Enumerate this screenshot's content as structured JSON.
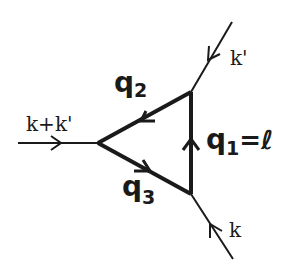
{
  "diagram": {
    "type": "feynman-triangle-diagram",
    "colors": {
      "line": "#1a1a1a",
      "background": "#ffffff"
    },
    "vertices": [
      {
        "id": "left",
        "x": 98,
        "y": 143
      },
      {
        "id": "top-right",
        "x": 191,
        "y": 92
      },
      {
        "id": "bottom-right",
        "x": 191,
        "y": 194
      }
    ],
    "external_lines": [
      {
        "id": "incoming-sum",
        "label": "k+k'",
        "direction": "into left vertex"
      },
      {
        "id": "incoming-k-prime",
        "label": "k'",
        "direction": "into top-right vertex"
      },
      {
        "id": "incoming-k",
        "label": "k",
        "direction": "into bottom-right vertex"
      }
    ],
    "internal_lines": [
      {
        "id": "q1",
        "label_main": "q",
        "label_sub": "1",
        "label_suffix": "=ℓ",
        "direction": "bottom-right to top-right"
      },
      {
        "id": "q2",
        "label_main": "q",
        "label_sub": "2",
        "direction": "top-right to left"
      },
      {
        "id": "q3",
        "label_main": "q",
        "label_sub": "3",
        "direction": "left to bottom-right"
      }
    ]
  },
  "labels": {
    "k_plus_k_prime": "k+k'",
    "k_prime": "k'",
    "k": "k",
    "q1_main": "q",
    "q1_sub": "1",
    "q1_suffix": "=ℓ",
    "q2_main": "q",
    "q2_sub": "2",
    "q3_main": "q",
    "q3_sub": "3"
  }
}
